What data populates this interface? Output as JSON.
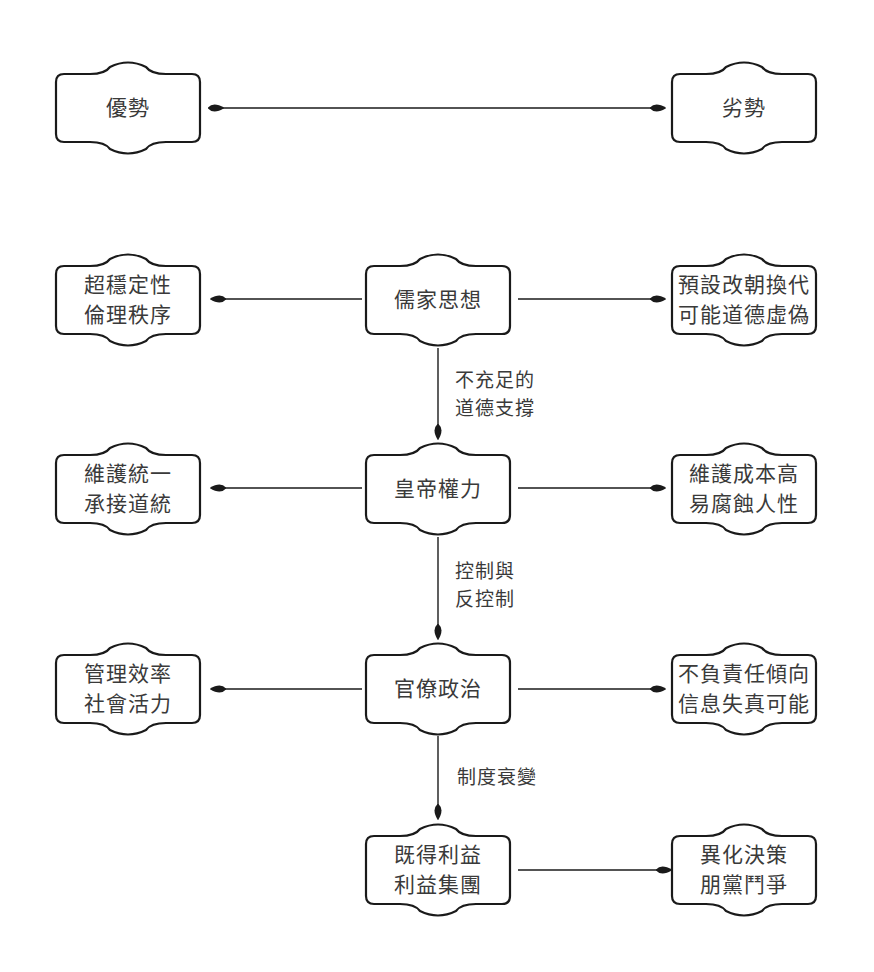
{
  "header": {
    "left": "優勢",
    "right": "劣勢"
  },
  "rows": [
    {
      "center": [
        "儒家思想"
      ],
      "left": [
        "超穩定性",
        "倫理秩序"
      ],
      "right": [
        "預設改朝換代",
        "可能道德虛偽"
      ]
    },
    {
      "center": [
        "皇帝權力"
      ],
      "left": [
        "維護統一",
        "承接道統"
      ],
      "right": [
        "維護成本高",
        "易腐蝕人性"
      ]
    },
    {
      "center": [
        "官僚政治"
      ],
      "left": [
        "管理效率",
        "社會活力"
      ],
      "right": [
        "不負責任傾向",
        "信息失真可能"
      ]
    },
    {
      "center": [
        "既得利益",
        "利益集團"
      ],
      "right": [
        "異化決策",
        "朋黨鬥爭"
      ]
    }
  ],
  "edges": [
    {
      "label": [
        "不充足的",
        "道德支撐"
      ]
    },
    {
      "label": [
        "控制與",
        "反控制"
      ]
    },
    {
      "label": [
        "制度衰變"
      ]
    }
  ],
  "colors": {
    "stroke": "#1a1a1a",
    "text": "#3a3a3a",
    "background": "#ffffff"
  }
}
